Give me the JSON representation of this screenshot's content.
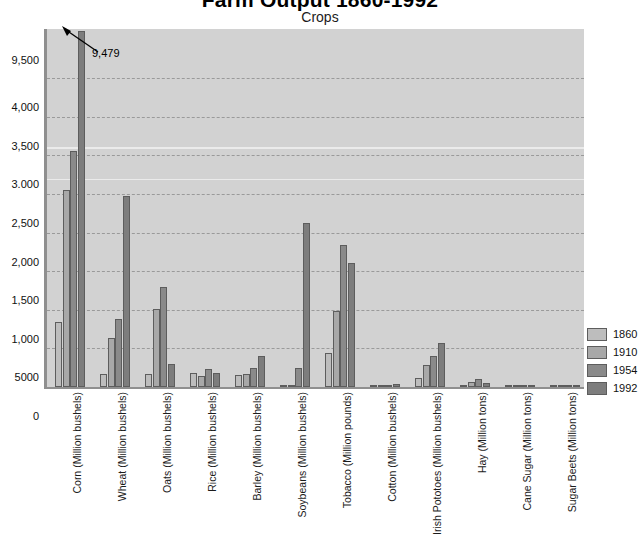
{
  "chart_data": {
    "type": "bar",
    "title": "Farm Output 1860-1992",
    "subtitle": "Crops",
    "xlabel": "",
    "ylabel": "",
    "grid": true,
    "legend_position": "right",
    "ylim": [
      0,
      4250
    ],
    "broken_axis": true,
    "ytick_labels": [
      "9,500",
      "4,000",
      "3,500",
      "3.000",
      "2,500",
      "2,000",
      "1,500",
      "1,000",
      "5000",
      "0"
    ],
    "ytick_values": [
      9500,
      4000,
      3500,
      3000,
      2500,
      2000,
      1500,
      1000,
      500,
      0
    ],
    "categories": [
      "Corn (Million bushels)",
      "Wheat (Million bushels)",
      "Oats (Million bushels)",
      "Rice (Million bushels)",
      "Barley (Million bushels)",
      "Soybeans (Million bushels)",
      "Tobacco (Million pounds)",
      "Cotton (Million bushels)",
      "Irish Pototoes (Million bushels)",
      "Hay (Million tons)",
      "Cane Sugar (Million tons)",
      "Sugar Beets (Million tons)"
    ],
    "series": [
      {
        "name": "1860",
        "color": "#bdbdbd",
        "values": [
          838,
          173,
          173,
          187,
          153,
          0,
          434,
          11,
          111,
          19,
          0,
          0
        ]
      },
      {
        "name": "1910",
        "color": "#a8a8a8",
        "values": [
          2552,
          635,
          1007,
          145,
          174,
          0,
          980,
          22,
          290,
          70,
          8,
          13
        ]
      },
      {
        "name": "1954",
        "color": "#8a8a8a",
        "values": [
          3050,
          884,
          1290,
          234,
          251,
          240,
          1840,
          22,
          405,
          104,
          8,
          13
        ]
      },
      {
        "name": "1992",
        "color": "#7d7d7d",
        "values": [
          9479,
          2467,
          294,
          180,
          400,
          2120,
          1600,
          34,
          570,
          48,
          8,
          22
        ]
      }
    ],
    "annotations": [
      {
        "text": "9,479",
        "series": "1992",
        "category": "Corn (Million bushels)"
      }
    ]
  },
  "legend": {
    "items": [
      {
        "label": "1860"
      },
      {
        "label": "1910"
      },
      {
        "label": "1954"
      },
      {
        "label": "1992"
      }
    ]
  }
}
